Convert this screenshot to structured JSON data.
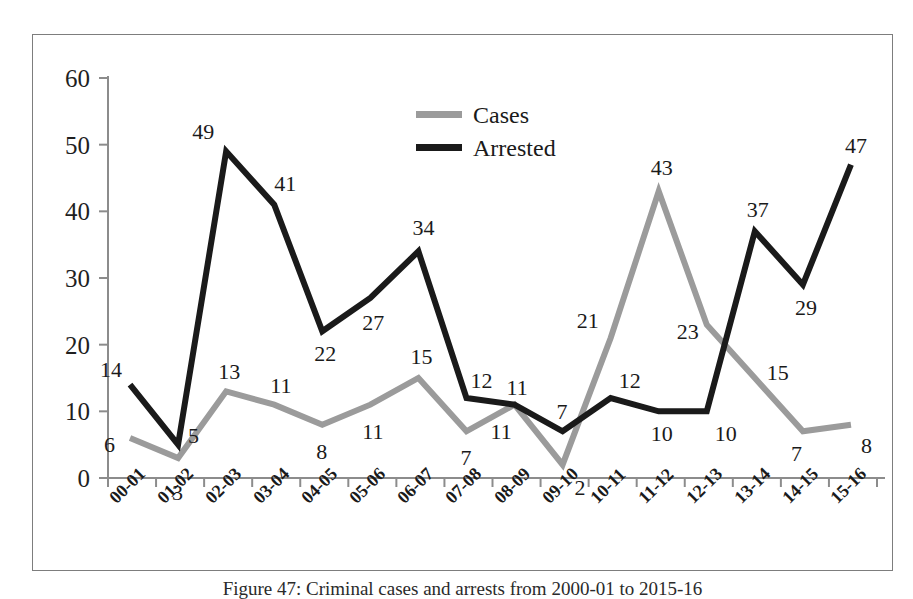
{
  "chart_data": {
    "type": "line",
    "title": "",
    "xlabel": "",
    "ylabel": "",
    "ylim": [
      0,
      60
    ],
    "yticks": [
      0,
      10,
      20,
      30,
      40,
      50,
      60
    ],
    "grid": false,
    "legend_position": "top-center",
    "categories": [
      "00-01",
      "01-02",
      "02-03",
      "03-04",
      "04-05",
      "05-06",
      "06-07",
      "07-08",
      "08-09",
      "09-10",
      "10-11",
      "11-12",
      "12-13",
      "13-14",
      "14-15",
      "15-16"
    ],
    "series": [
      {
        "name": "Cases",
        "color": "#9b9b9b",
        "values": [
          6,
          3,
          13,
          11,
          8,
          11,
          15,
          7,
          11,
          2,
          21,
          43,
          23,
          15,
          7,
          8
        ]
      },
      {
        "name": "Arrested",
        "color": "#1a1a1a",
        "values": [
          14,
          5,
          49,
          41,
          22,
          27,
          34,
          12,
          11,
          7,
          12,
          10,
          10,
          37,
          29,
          47
        ]
      }
    ]
  },
  "legend": {
    "items": [
      {
        "label": "Cases",
        "color": "#9b9b9b"
      },
      {
        "label": "Arrested",
        "color": "#1a1a1a"
      }
    ]
  },
  "caption": {
    "text": "Figure 47: Criminal cases and arrests from 2000-01 to 2015-16"
  },
  "colors": {
    "frame": "#7d7d7d",
    "axis": "#8c8c8c",
    "cases": "#9b9b9b",
    "arrested": "#1a1a1a",
    "text": "#1a1a1a"
  }
}
